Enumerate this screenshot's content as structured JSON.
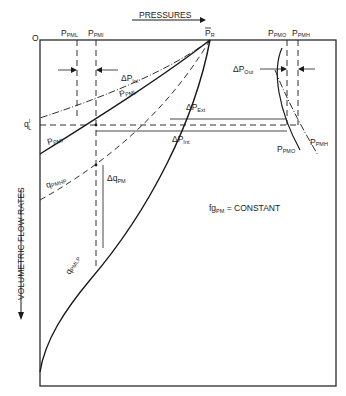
{
  "diagram": {
    "type": "pressure vs volumetric flow rate diagram",
    "axes": {
      "origin": "O",
      "x_label": "PRESSURES",
      "y_label": "VOLUMETRIC FLOW RATES"
    },
    "top_labels": {
      "p_pml": {
        "main": "P",
        "sub": "PML"
      },
      "p_pmi": {
        "main": "P",
        "sub": "PMI"
      },
      "p_r": {
        "main": "P",
        "sub": "R"
      },
      "p_pmo": {
        "main": "P",
        "sub": "PMO"
      },
      "p_pmh": {
        "main": "P",
        "sub": "PMH"
      }
    },
    "curve_labels": {
      "p_pml": {
        "main": "P",
        "sub": "PML"
      },
      "p_pmi": {
        "main": "P",
        "sub": "PMI"
      },
      "q_pmhp": {
        "main": "q",
        "sub": "PMHP"
      },
      "q_pmlp": {
        "main": "q",
        "sub": "PMLP"
      },
      "p_pmo": {
        "main": "P",
        "sub": "PMO"
      },
      "p_pmh": {
        "main": "P",
        "sub": "PMH"
      }
    },
    "deltas": {
      "dp_inl": {
        "main": "ΔP",
        "sub": "Inl"
      },
      "dp_ext": {
        "main": "ΔP",
        "sub": "Ext"
      },
      "dp_int": {
        "main": "ΔP",
        "sub": "Int"
      },
      "dp_out": {
        "main": "ΔP",
        "sub": "Out"
      },
      "dq_pm": {
        "main": "Δq",
        "sub": "PM"
      }
    },
    "q_l": {
      "main": "q",
      "sup": "I",
      "sub": "L"
    },
    "annotation": {
      "pre": "fg",
      "sub": "PM",
      "post": " = CONSTANT"
    }
  }
}
